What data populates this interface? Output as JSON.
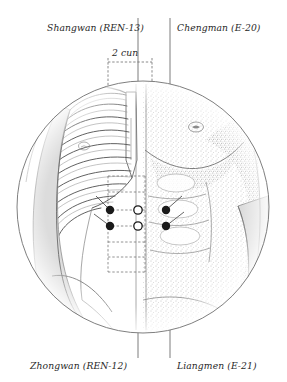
{
  "figure": {
    "type": "anatomical-illustration",
    "background_color": "#ffffff",
    "ink_color": "#2b2b2b",
    "shade_color": "#d8d8d8",
    "stipple_color": "#9a9a9a"
  },
  "labels": {
    "shangwan": "Shangwan (REN-13)",
    "chengman": "Chengman (E-20)",
    "zhongwan": "Zhongwan (REN-12)",
    "liangmen": "Liangmen (E-21)",
    "cun": "2 cun"
  },
  "points": [
    {
      "id": "shangwan",
      "marker": "open",
      "cx": 138,
      "cy": 210,
      "label_ref": "shangwan"
    },
    {
      "id": "zhongwan",
      "marker": "open",
      "cx": 138,
      "cy": 226,
      "label_ref": "zhongwan"
    },
    {
      "id": "chengman-right",
      "marker": "filled",
      "cx": 166,
      "cy": 210,
      "label_ref": "chengman"
    },
    {
      "id": "liangmen-right",
      "marker": "filled",
      "cx": 166,
      "cy": 226,
      "label_ref": "liangmen"
    },
    {
      "id": "chengman-left",
      "marker": "filled",
      "cx": 110,
      "cy": 210,
      "label_ref": "chengman"
    },
    {
      "id": "liangmen-left",
      "marker": "filled",
      "cx": 110,
      "cy": 226,
      "label_ref": "liangmen"
    }
  ],
  "measurement": {
    "text": "2 cun",
    "bracket_left_x": 108,
    "bracket_right_x": 152,
    "bracket_y": 62,
    "ladder_top_y": 176,
    "ladder_bottom_y": 272,
    "rung_spacing": 16
  },
  "circle": {
    "cx": 143,
    "cy": 207,
    "r": 126
  },
  "leader_lines": [
    {
      "id": "shangwan-leader",
      "x": 138,
      "y1": 18,
      "y2": 207
    },
    {
      "id": "chengman-leader",
      "x": 170,
      "y1": 18,
      "y2": 207
    },
    {
      "id": "zhongwan-leader",
      "x": 138,
      "y1": 207,
      "y2": 358
    },
    {
      "id": "liangmen-leader",
      "x": 170,
      "y1": 207,
      "y2": 358
    }
  ]
}
